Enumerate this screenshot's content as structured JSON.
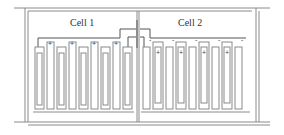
{
  "diagram": {
    "type": "battery-cells",
    "cells": [
      {
        "label": "Cell 1",
        "plate_pairs": 5,
        "top_signs": [
          "+",
          "+",
          "+",
          "+"
        ]
      },
      {
        "label": "Cell 2",
        "plate_pairs": 4,
        "top_signs": [
          "-",
          "-",
          "-",
          "-",
          "-"
        ],
        "plate_signs": [
          "+",
          "+",
          "+",
          "+"
        ]
      }
    ],
    "colors": {
      "line": "#8a8a8a",
      "text": "#333333",
      "background": "#ffffff"
    }
  }
}
